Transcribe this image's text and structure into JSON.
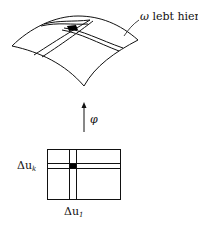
{
  "figure": {
    "surface_label": {
      "symbol": "ω",
      "text": "lebt hier"
    },
    "map_label": {
      "symbol": "φ"
    },
    "domain_labels": {
      "left": {
        "base": "Δu",
        "sub": "k"
      },
      "bottom": {
        "base": "Δu",
        "sub": "1"
      }
    },
    "colors": {
      "stroke": "#111111",
      "fill_patch": "#000000",
      "background": "#ffffff"
    }
  }
}
